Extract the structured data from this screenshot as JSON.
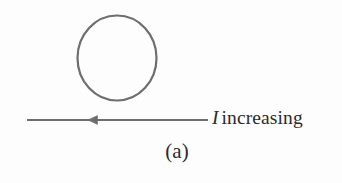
{
  "figure": {
    "panel_label": "(a)",
    "current_symbol": "I",
    "current_state": "increasing",
    "colors": {
      "background": "#fdfdfd",
      "stroke": "#6e6e6e",
      "text": "#2b2b2b"
    },
    "loop": {
      "name": "conducting-loop",
      "shape": "circle",
      "center_x": 117,
      "center_y": 58,
      "radius_x": 40,
      "radius_y": 43,
      "stroke_width": 2.2
    },
    "wire": {
      "name": "current-carrying-wire",
      "orientation": "horizontal",
      "y": 120,
      "x_start": 27,
      "x_end": 208,
      "stroke_width": 2.2,
      "arrow_direction": "left",
      "arrow_tip_x": 88,
      "arrow_base_x": 97
    }
  }
}
